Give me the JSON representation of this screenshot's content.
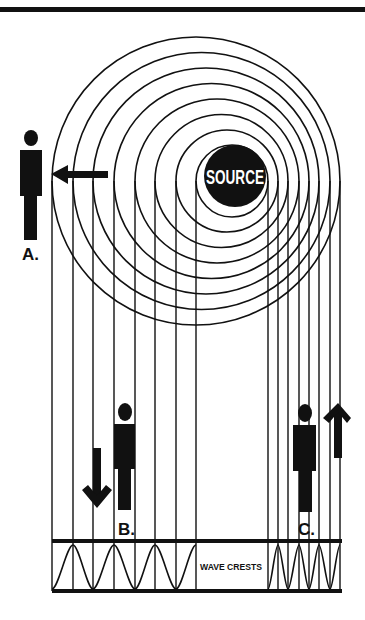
{
  "diagram": {
    "type": "doppler-effect",
    "source": {
      "label": "SOURCE",
      "cx": 235,
      "cy": 176,
      "r": 31
    },
    "rings": [
      {
        "cx": 196,
        "cy": 181,
        "r": 144
      },
      {
        "cx": 201.5,
        "cy": 181,
        "r": 128.5
      },
      {
        "cx": 206,
        "cy": 181,
        "r": 113
      },
      {
        "cx": 211.5,
        "cy": 181,
        "r": 97.5
      },
      {
        "cx": 217,
        "cy": 181,
        "r": 82
      },
      {
        "cx": 221.5,
        "cy": 181,
        "r": 66.5
      },
      {
        "cx": 227,
        "cy": 181,
        "r": 51
      },
      {
        "cx": 232,
        "cy": 181,
        "r": 36
      }
    ],
    "vertical_lines_left_x": [
      52,
      73,
      93,
      114,
      135,
      155,
      176,
      196
    ],
    "vertical_lines_right_x": [
      268,
      278,
      288,
      299,
      309,
      319,
      330,
      340
    ],
    "observers": [
      {
        "id": "A",
        "label": "A.",
        "arrow": "left"
      },
      {
        "id": "B",
        "label": "B.",
        "arrow": "down"
      },
      {
        "id": "C",
        "label": "C.",
        "arrow": "up"
      }
    ],
    "wave_strip": {
      "label": "WAVE CRESTS",
      "top_y": 541,
      "bottom_y": 591,
      "left_x": 52,
      "right_x": 342
    },
    "colors": {
      "ink": "#111111",
      "background": "#ffffff"
    }
  }
}
